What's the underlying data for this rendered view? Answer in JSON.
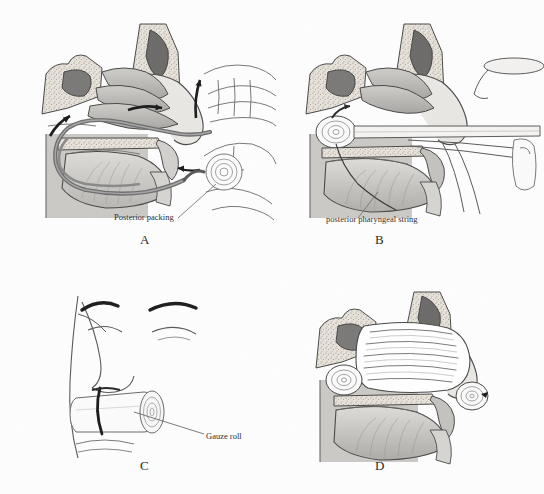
{
  "figure": {
    "background_color": "#fdfdfd",
    "ink_color": "#3a3a3a",
    "panel_count": 4
  },
  "panels": [
    {
      "id": "A",
      "letter": "A",
      "caption": "Posterior packing",
      "view": "sagittal-head-section",
      "description": "Catheter passed through nose into oropharynx, posterior packing pulled into nasopharynx",
      "callouts": [
        {
          "name": "posterior-packing",
          "label": "Posterior packing"
        }
      ],
      "arrows": 3,
      "hands": 2
    },
    {
      "id": "B",
      "letter": "B",
      "caption": "posterior pharyngeal string",
      "view": "sagittal-head-section",
      "description": "Pack seated in nasopharynx with string retrieved through the mouth using forceps and tongue depressor",
      "callouts": [
        {
          "name": "posterior-pharyngeal-string",
          "label": "posterior pharyngeal string"
        }
      ],
      "instruments": [
        "tongue-depressor",
        "forceps"
      ]
    },
    {
      "id": "C",
      "letter": "C",
      "caption": "Gauze roll",
      "view": "frontal-face",
      "description": "Strings tied over a gauze roll bolster at the nasal columella",
      "callouts": [
        {
          "name": "gauze-roll",
          "label": "Gauze roll"
        }
      ]
    },
    {
      "id": "D",
      "letter": "D",
      "caption": "",
      "view": "sagittal-head-section",
      "description": "Anterior nasal cavity filled with accordion-layered gauze packing",
      "callouts": [],
      "packing_layers": 5
    }
  ],
  "palette": {
    "bone_stipple": "#ded9d1",
    "mucosa_light": "#d8d6d2",
    "mucosa_mid": "#b6b4b1",
    "mucosa_dark": "#8e8c8a",
    "sinus_dark": "#6f6d6b",
    "catheter": "#6b6b6b",
    "outline": "#4a4a4a",
    "gauze": "#ffffff",
    "skin_line": "#5a5a5a"
  }
}
